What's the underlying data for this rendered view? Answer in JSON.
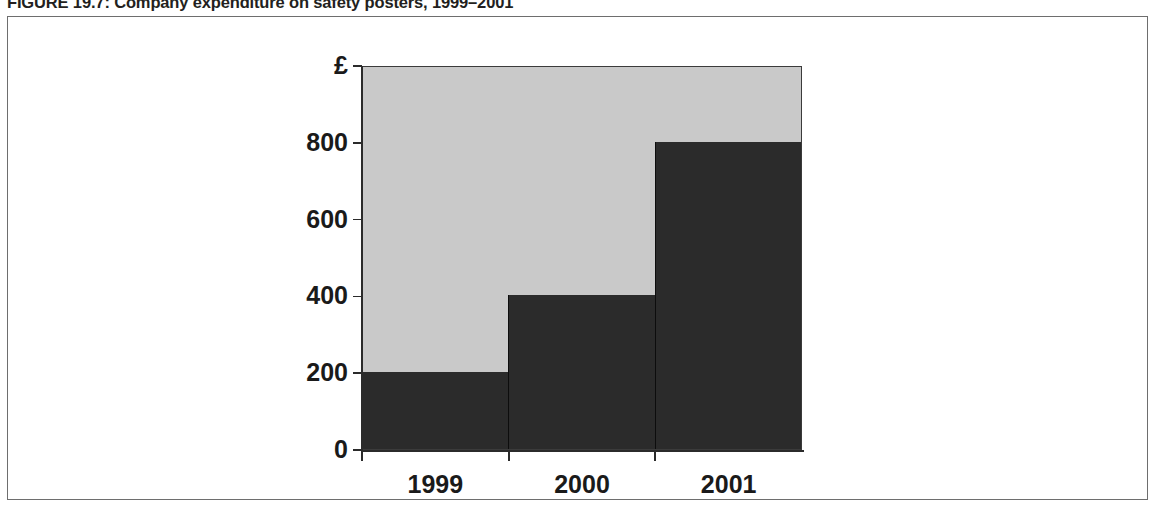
{
  "figure": {
    "caption": "FIGURE 19.7: Company expenditure on safety posters, 1999–2001"
  },
  "chart_data": {
    "type": "bar",
    "title": "Company expenditure on safety posters, 1999–2001",
    "categories": [
      "1999",
      "2000",
      "2001"
    ],
    "values": [
      200,
      400,
      800
    ],
    "xlabel": "",
    "ylabel": "£",
    "ylim": [
      0,
      1000
    ],
    "yticks": [
      0,
      200,
      400,
      600,
      800
    ],
    "ytick_labels": [
      "0",
      "200",
      "400",
      "600",
      "800"
    ],
    "y_axis_unit_label": "£",
    "grid": false,
    "legend": "none",
    "bar_color": "#2b2b2b",
    "plot_background_color": "#c9c9c9",
    "axis_color": "#2b2b2b",
    "bars_adjacent": true
  },
  "colors": {
    "frame_border": "#6e6e6e",
    "plot_border": "#3b3b3b",
    "text": "#1a1a1a",
    "caption_text": "#231f20",
    "page_background": "#ffffff"
  }
}
